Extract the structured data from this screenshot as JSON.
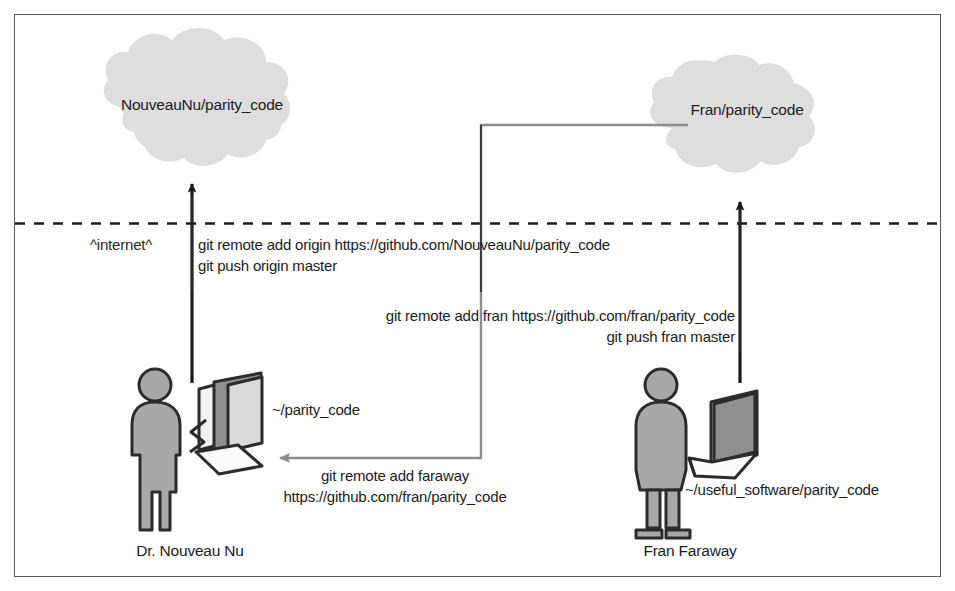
{
  "figure": {
    "border_color": "#5a5a5a",
    "background": "#ffffff"
  },
  "palette": {
    "cloud_fill": "#dedede",
    "ink": "#1b1b1b",
    "line": "#3b3b3b",
    "gray_arrow": "#8c8c8c",
    "person_fill": "#a8a8a8",
    "screen_fill": "#8f8f8f",
    "device_light": "#f2f2f2"
  },
  "clouds": [
    {
      "id": "cloud-left",
      "label": "NouveauNu/parity_code"
    },
    {
      "id": "cloud-right",
      "label": "Fran/parity_code"
    }
  ],
  "boundary": {
    "label": "^internet^",
    "style": "dashed"
  },
  "commands": {
    "origin": {
      "line1": "git remote add origin https://github.com/NouveauNu/parity_code",
      "line2": "git push origin master"
    },
    "fran": {
      "line1": "git remote add fran https://github.com/fran/parity_code",
      "line2": "git push fran master"
    },
    "faraway": {
      "line1": "git remote add faraway",
      "line2": "https://github.com/fran/parity_code"
    }
  },
  "actors": [
    {
      "id": "actor-left",
      "name": "Dr. Nouveau Nu",
      "device": "desktop-computer",
      "repo_path": "~/parity_code"
    },
    {
      "id": "actor-right",
      "name": "Fran Faraway",
      "device": "laptop-computer",
      "repo_path": "~/useful_software/parity_code"
    }
  ]
}
